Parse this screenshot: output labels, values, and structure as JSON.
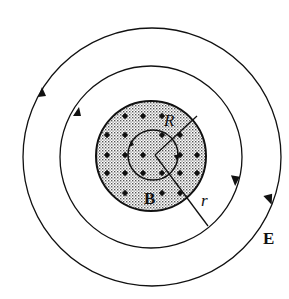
{
  "diagram": {
    "labels": {
      "field_b": "B",
      "field_e": "E",
      "radius_big": "R",
      "radius_small": "r"
    },
    "colors": {
      "stroke": "#111111",
      "shade": "#bdbdbd",
      "background": "#ffffff"
    },
    "geometry": {
      "center": [
        153,
        156
      ],
      "outer_loop_radius": 128,
      "middle_loop_radius": 90,
      "field_region_radius": 55,
      "inner_loop_radius": 25
    },
    "dots_B_out_of_page": [
      [
        125,
        116
      ],
      [
        143,
        116
      ],
      [
        162,
        116
      ],
      [
        107,
        135
      ],
      [
        125,
        135
      ],
      [
        162,
        135
      ],
      [
        180,
        135
      ],
      [
        107,
        155
      ],
      [
        125,
        155
      ],
      [
        143,
        155
      ],
      [
        180,
        155
      ],
      [
        197,
        155
      ],
      [
        107,
        173
      ],
      [
        125,
        173
      ],
      [
        143,
        173
      ],
      [
        162,
        173
      ],
      [
        180,
        173
      ],
      [
        197,
        173
      ],
      [
        125,
        193
      ],
      [
        162,
        193
      ],
      [
        180,
        193
      ]
    ]
  }
}
